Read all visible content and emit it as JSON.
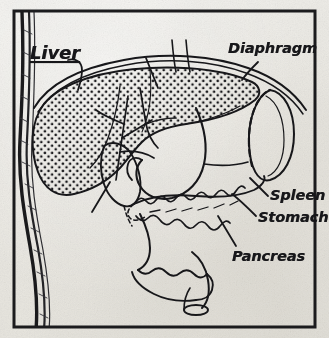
{
  "figure": {
    "medium": "scanned halftone line drawing on aged paper",
    "background_color": "#eceae4",
    "ink_color": "#17171a",
    "frame": {
      "visible": true,
      "color": "#1b1b1d"
    }
  },
  "labels": {
    "liver": "Liver",
    "hepatic_ducts_line1": "Hepatic",
    "hepatic_ducts_line2": "ducts",
    "diaphragm": "Diaphragm",
    "spleen": "Spleen",
    "stomach": "Stomach",
    "pancreas": "Pancreas",
    "gall_bladder_line1": "Gall",
    "gall_bladder_line2": "bladder"
  },
  "structures": [
    {
      "name": "liver",
      "fill": "stippled",
      "label": "Liver"
    },
    {
      "name": "hepatic-ducts",
      "fill": "line",
      "label": "Hepatic ducts"
    },
    {
      "name": "diaphragm",
      "fill": "double-line",
      "label": "Diaphragm"
    },
    {
      "name": "spleen",
      "fill": "outline",
      "label": "Spleen"
    },
    {
      "name": "stomach",
      "fill": "outline",
      "label": "Stomach"
    },
    {
      "name": "pancreas",
      "fill": "lobulated",
      "label": "Pancreas"
    },
    {
      "name": "gall-bladder",
      "fill": "outline",
      "label": "Gall bladder"
    },
    {
      "name": "duodenum",
      "fill": "outline",
      "label": ""
    },
    {
      "name": "body-wall",
      "fill": "dark-hatched",
      "label": ""
    }
  ]
}
